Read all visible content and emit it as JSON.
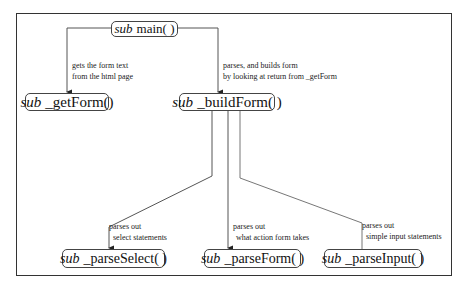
{
  "diagram": {
    "nodes": {
      "main": {
        "keyword": "sub",
        "name": "main( )"
      },
      "getForm": {
        "keyword": "sub",
        "name": "_getForm()"
      },
      "buildForm": {
        "keyword": "sub",
        "name": "_buildForm( )"
      },
      "parseSelect": {
        "keyword": "sub",
        "name": "_parseSelect( )"
      },
      "parseForm": {
        "keyword": "sub",
        "name": "_parseForm( )"
      },
      "parseInput": {
        "keyword": "sub",
        "name": "_parseInput( )"
      }
    },
    "edges": {
      "main_to_getForm": {
        "line1": "gets the form text",
        "line2": "from the html page"
      },
      "main_to_buildForm": {
        "line1": "parses, and builds form",
        "line2": "by looking at return from _getForm"
      },
      "buildForm_to_parseSelect": {
        "line1": "parses out",
        "line2": "select statements"
      },
      "buildForm_to_parseForm": {
        "line1": "parses out",
        "line2": "what action form takes"
      },
      "buildForm_to_parseInput": {
        "line1": "parses out",
        "line2": "simple input statements"
      }
    },
    "colors": {
      "stroke": "#444444",
      "text": "#111111",
      "background": "#ffffff"
    }
  }
}
